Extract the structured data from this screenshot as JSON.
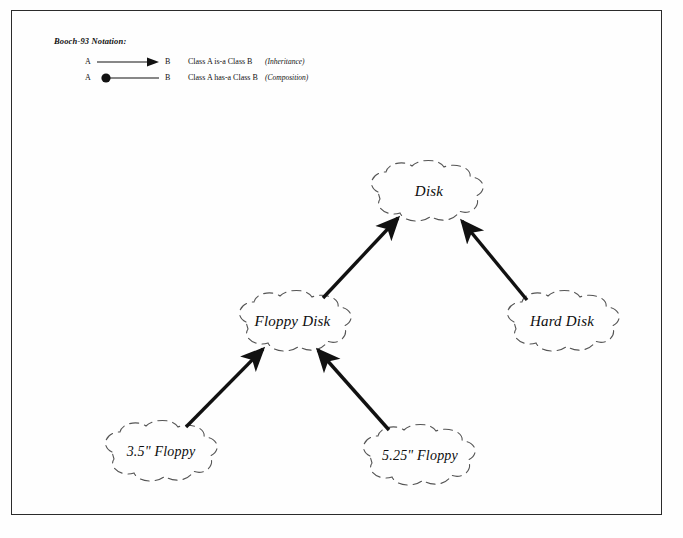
{
  "legend": {
    "title": "Booch-93 Notation:",
    "rows": [
      {
        "from": "A",
        "to": "B",
        "description": "Class A  is-a  Class B",
        "note": "(Inheritance)",
        "symbol": "arrow-open"
      },
      {
        "from": "A",
        "to": "B",
        "description": "Class A  has-a  Class B",
        "note": "(Composition)",
        "symbol": "filled-circle-line"
      }
    ]
  },
  "diagram": {
    "type": "class-inheritance-hierarchy",
    "nodes": [
      {
        "id": "disk",
        "label": "Disk"
      },
      {
        "id": "floppy-disk",
        "label": "Floppy Disk"
      },
      {
        "id": "hard-disk",
        "label": "Hard Disk"
      },
      {
        "id": "floppy-35",
        "label": "3.5\" Floppy"
      },
      {
        "id": "floppy-525",
        "label": "5.25\" Floppy"
      }
    ],
    "edges": [
      {
        "from": "floppy-disk",
        "to": "disk",
        "kind": "is-a"
      },
      {
        "from": "hard-disk",
        "to": "disk",
        "kind": "is-a"
      },
      {
        "from": "floppy-35",
        "to": "floppy-disk",
        "kind": "is-a"
      },
      {
        "from": "floppy-525",
        "to": "floppy-disk",
        "kind": "is-a"
      }
    ]
  },
  "colors": {
    "ink": "#111111",
    "cloud_outline": "#555555",
    "border": "#2b2b2b",
    "background": "#fefefe"
  }
}
